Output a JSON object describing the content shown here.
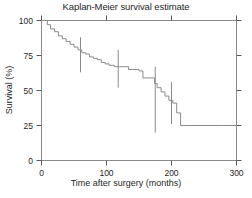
{
  "chart_data": {
    "type": "line",
    "title": "Kaplan-Meier survival estimate",
    "xlabel": "Time after surgery (months)",
    "ylabel": "Survival (%)",
    "xlim": [
      0,
      300
    ],
    "ylim": [
      0,
      100
    ],
    "xticks": [
      0,
      100,
      200,
      300
    ],
    "xtick_labels": [
      "0",
      "100",
      "200",
      "300"
    ],
    "yticks": [
      0,
      25,
      50,
      75,
      100
    ],
    "ytick_labels": [
      "0",
      "25",
      "50",
      "75",
      "100"
    ],
    "grid": false,
    "legend": "none",
    "series": [
      {
        "name": "Kaplan-Meier survival estimate",
        "style": "step",
        "color": "#8a8a8a",
        "x": [
          0,
          4,
          9,
          14,
          20,
          26,
          32,
          38,
          44,
          50,
          56,
          62,
          68,
          74,
          80,
          86,
          92,
          98,
          104,
          112,
          120,
          128,
          134,
          142,
          150,
          156,
          162,
          168,
          174,
          178,
          184,
          190,
          196,
          202,
          208,
          214,
          224,
          278,
          300
        ],
        "y": [
          100,
          100,
          97,
          94,
          92,
          89,
          87,
          85,
          83,
          81,
          79,
          77,
          76,
          74,
          73,
          72,
          70,
          69,
          68,
          67,
          67,
          67,
          65,
          65,
          64,
          59,
          59,
          59,
          55,
          52,
          49,
          46,
          43,
          41,
          34,
          25,
          25,
          25,
          13
        ]
      }
    ],
    "error_bars": [
      {
        "x": 60,
        "y": 77,
        "low": 63,
        "high": 88
      },
      {
        "x": 118,
        "y": 67,
        "low": 52,
        "high": 79
      },
      {
        "x": 175,
        "y": 52,
        "low": 20,
        "high": 67
      },
      {
        "x": 200,
        "y": 41,
        "low": 26,
        "high": 56
      }
    ]
  }
}
